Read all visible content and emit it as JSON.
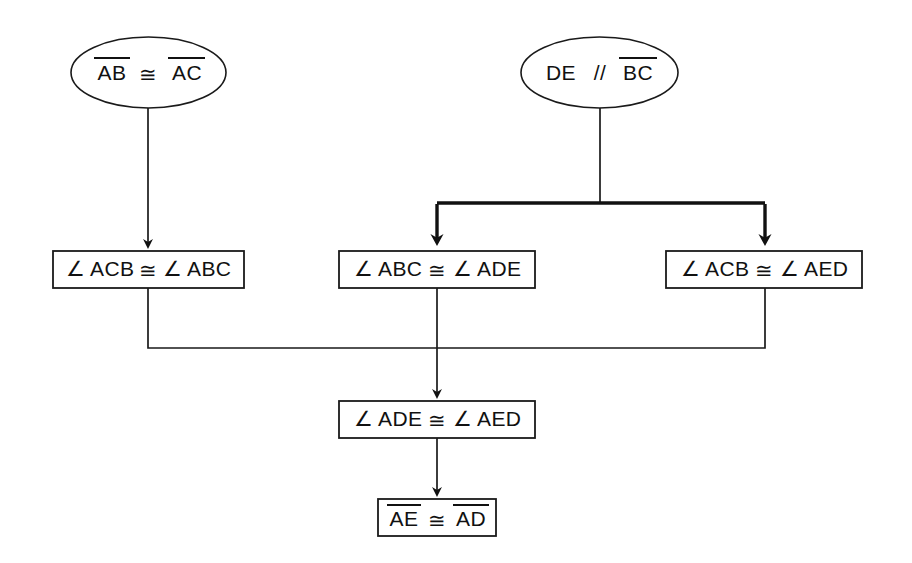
{
  "diagram": {
    "background_color": "#ffffff",
    "line_color": "#1a1a1a",
    "text_color": "#111111",
    "given_nodes": [
      {
        "id": "given-ab-ac",
        "shape": "ellipse",
        "label": "AB ≅ AC",
        "parts": [
          {
            "text": "AB",
            "overline": true
          },
          {
            "text": "≅",
            "overline": false
          },
          {
            "text": "AC",
            "overline": true
          }
        ]
      },
      {
        "id": "given-de-bc",
        "shape": "ellipse",
        "label": "DE // BC",
        "parts": [
          {
            "text": "DE",
            "overline": false
          },
          {
            "text": "//",
            "overline": false
          },
          {
            "text": "BC",
            "overline": true
          }
        ]
      }
    ],
    "statement_nodes": [
      {
        "id": "stmt-acb-abc",
        "shape": "rectangle",
        "label": "∠ ACB ≅ ∠ ABC",
        "parts": [
          {
            "text": "∠ ACB",
            "overline": false
          },
          {
            "text": "≅",
            "overline": false
          },
          {
            "text": "∠ ABC",
            "overline": false
          }
        ]
      },
      {
        "id": "stmt-abc-ade",
        "shape": "rectangle",
        "label": "∠ ABC ≅ ∠ ADE",
        "parts": [
          {
            "text": "∠ ABC",
            "overline": false
          },
          {
            "text": "≅",
            "overline": false
          },
          {
            "text": "∠ ADE",
            "overline": false
          }
        ]
      },
      {
        "id": "stmt-acb-aed",
        "shape": "rectangle",
        "label": "∠ ACB ≅ ∠ AED",
        "parts": [
          {
            "text": "∠ ACB",
            "overline": false
          },
          {
            "text": "≅",
            "overline": false
          },
          {
            "text": "∠ AED",
            "overline": false
          }
        ]
      },
      {
        "id": "stmt-ade-aed",
        "shape": "rectangle",
        "label": "∠ ADE ≅ ∠ AED",
        "parts": [
          {
            "text": "∠ ADE",
            "overline": false
          },
          {
            "text": "≅",
            "overline": false
          },
          {
            "text": "∠ AED",
            "overline": false
          }
        ]
      },
      {
        "id": "stmt-ae-ad",
        "shape": "rectangle",
        "label": "AE ≅ AD",
        "parts": [
          {
            "text": "AE",
            "overline": true
          },
          {
            "text": "≅",
            "overline": false
          },
          {
            "text": "AD",
            "overline": true
          }
        ]
      }
    ],
    "edges": [
      {
        "from": "given-ab-ac",
        "to": "stmt-acb-abc",
        "style": "thin",
        "arrow": true
      },
      {
        "from": "given-de-bc",
        "to": "stmt-abc-ade",
        "style": "thick",
        "arrow": true
      },
      {
        "from": "given-de-bc",
        "to": "stmt-acb-aed",
        "style": "thick",
        "arrow": true
      },
      {
        "from": "stmt-acb-abc",
        "to": "stmt-ade-aed",
        "style": "thin",
        "arrow": false
      },
      {
        "from": "stmt-abc-ade",
        "to": "stmt-ade-aed",
        "style": "thin",
        "arrow": true
      },
      {
        "from": "stmt-acb-aed",
        "to": "stmt-ade-aed",
        "style": "thin",
        "arrow": false
      },
      {
        "from": "stmt-ade-aed",
        "to": "stmt-ae-ad",
        "style": "thin",
        "arrow": true
      }
    ]
  }
}
